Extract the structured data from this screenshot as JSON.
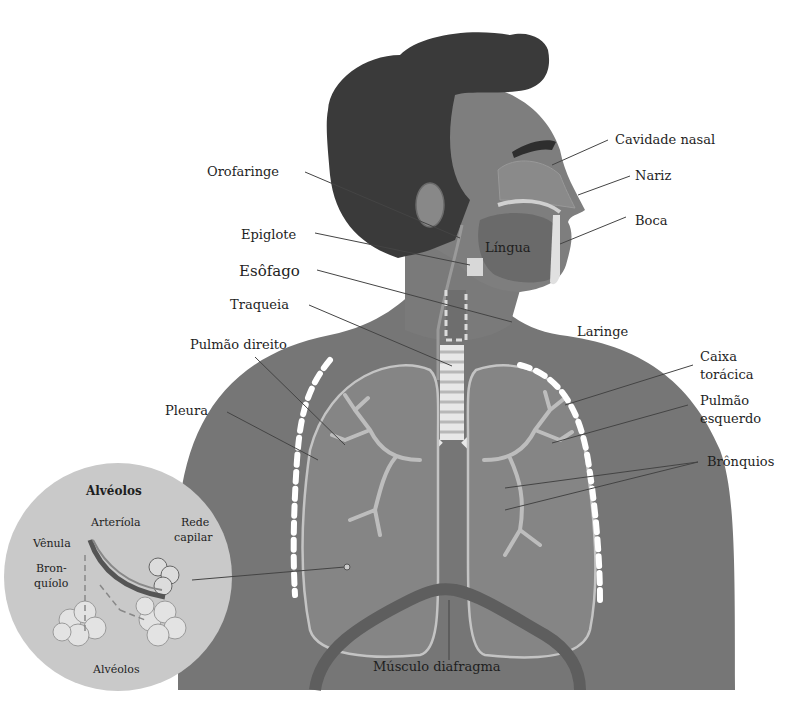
{
  "figure": {
    "colors": {
      "background": "#ffffff",
      "hair": "#3a3a3a",
      "skin": "#7e7e7e",
      "skin_light": "#8e8e8e",
      "body": "#767676",
      "lung": "#868686",
      "lung_outline": "#c4c4c4",
      "bronchi": "#bdbdbd",
      "ribs": "#ffffff",
      "trachea_ring": "#e8e8e8",
      "diaphragm": "#606060",
      "inset_circle": "#c9c9c9",
      "label_text": "#1e1e1e",
      "leader_line": "#444444"
    }
  },
  "labels": {
    "cavidade_nasal": "Cavidade nasal",
    "nariz": "Nariz",
    "boca": "Boca",
    "orofaringe": "Orofaringe",
    "lingua": "Língua",
    "epiglote": "Epiglote",
    "esofago": "Esôfago",
    "laringe": "Laringe",
    "traqueia": "Traqueia",
    "pulmao_direito": "Pulmão direito",
    "caixa_toracica_1": "Caixa",
    "caixa_toracica_2": "torácica",
    "pulmao_esquerdo_1": "Pulmão",
    "pulmao_esquerdo_2": "esquerdo",
    "pleura": "Pleura",
    "bronquios": "Brônquios",
    "musculo_diafragma": "Músculo diafragma"
  },
  "inset": {
    "title": "Alvéolos",
    "arteriola": "Arteríola",
    "rede_capilar_1": "Rede",
    "rede_capilar_2": "capilar",
    "venula": "Vênula",
    "bronquiolo_1": "Bron-",
    "bronquiolo_2": "quíolo",
    "alveolos": "Alvéolos"
  }
}
